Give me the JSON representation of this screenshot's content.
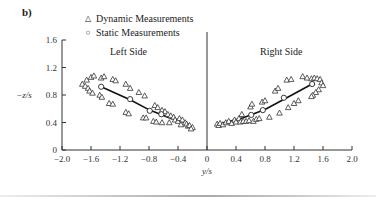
{
  "panel_label": "b)",
  "legend": {
    "dynamic": {
      "symbol": "△",
      "label": "Dynamic Measurements"
    },
    "static": {
      "symbol": "○",
      "label": "Static Measurements"
    }
  },
  "annotations": {
    "left": "Left Side",
    "right": "Right Side"
  },
  "chart_data": {
    "type": "scatter",
    "title": "",
    "xlabel": "y/s",
    "ylabel": "−z/s",
    "xlim": [
      -2.0,
      2.0
    ],
    "ylim": [
      0,
      1.6
    ],
    "x_ticks": [
      "−2.0",
      "−1.6",
      "−1.2",
      "−0.8",
      "−0.4",
      "0",
      "0.4",
      "0.8",
      "1.2",
      "1.6",
      "2.0"
    ],
    "y_ticks": [
      "0",
      "0.4",
      "0.8",
      "1.2",
      "1.6"
    ],
    "grid": false,
    "legend_position": "top-left",
    "annotations": [
      "Left Side",
      "Right Side"
    ],
    "series": [
      {
        "name": "Dynamic Measurements",
        "marker": "triangle",
        "points": [
          [
            -1.72,
            0.96
          ],
          [
            -1.68,
            0.93
          ],
          [
            -1.66,
            1.02
          ],
          [
            -1.64,
            0.9
          ],
          [
            -1.62,
            0.86
          ],
          [
            -1.6,
            1.06
          ],
          [
            -1.58,
            0.83
          ],
          [
            -1.56,
            1.08
          ],
          [
            -1.46,
            1.05
          ],
          [
            -1.42,
            1.07
          ],
          [
            -1.48,
            0.8
          ],
          [
            -1.45,
            0.77
          ],
          [
            -1.3,
            1.03
          ],
          [
            -1.26,
            1.01
          ],
          [
            -1.35,
            0.68
          ],
          [
            -1.3,
            0.67
          ],
          [
            -1.12,
            0.96
          ],
          [
            -1.06,
            0.9
          ],
          [
            -1.12,
            0.55
          ],
          [
            -1.08,
            0.53
          ],
          [
            -0.94,
            0.84
          ],
          [
            -0.86,
            0.79
          ],
          [
            -0.88,
            0.47
          ],
          [
            -0.84,
            0.47
          ],
          [
            -0.72,
            0.65
          ],
          [
            -0.68,
            0.62
          ],
          [
            -0.74,
            0.42
          ],
          [
            -0.7,
            0.41
          ],
          [
            -0.62,
            0.58
          ],
          [
            -0.58,
            0.56
          ],
          [
            -0.62,
            0.4
          ],
          [
            -0.54,
            0.52
          ],
          [
            -0.5,
            0.5
          ],
          [
            -0.46,
            0.48
          ],
          [
            -0.52,
            0.4
          ],
          [
            -0.44,
            0.44
          ],
          [
            -0.4,
            0.42
          ],
          [
            -0.38,
            0.46
          ],
          [
            -0.34,
            0.44
          ],
          [
            -0.3,
            0.4
          ],
          [
            -0.36,
            0.37
          ],
          [
            -0.28,
            0.38
          ],
          [
            -0.26,
            0.35
          ],
          [
            -0.24,
            0.36
          ],
          [
            -0.2,
            0.33
          ],
          [
            -0.22,
            0.31
          ],
          [
            0.14,
            0.38
          ],
          [
            0.16,
            0.36
          ],
          [
            0.18,
            0.39
          ],
          [
            0.22,
            0.37
          ],
          [
            0.26,
            0.4
          ],
          [
            0.3,
            0.42
          ],
          [
            0.34,
            0.39
          ],
          [
            0.38,
            0.44
          ],
          [
            0.4,
            0.41
          ],
          [
            0.44,
            0.46
          ],
          [
            0.46,
            0.41
          ],
          [
            0.48,
            0.52
          ],
          [
            0.5,
            0.42
          ],
          [
            0.54,
            0.42
          ],
          [
            0.58,
            0.43
          ],
          [
            0.6,
            0.63
          ],
          [
            0.62,
            0.67
          ],
          [
            0.64,
            0.42
          ],
          [
            0.68,
            0.45
          ],
          [
            0.72,
            0.46
          ],
          [
            0.76,
            0.7
          ],
          [
            0.8,
            0.72
          ],
          [
            0.86,
            0.48
          ],
          [
            0.94,
            0.86
          ],
          [
            0.98,
            0.9
          ],
          [
            1.0,
            0.54
          ],
          [
            1.1,
            1.02
          ],
          [
            1.16,
            1.03
          ],
          [
            1.12,
            0.62
          ],
          [
            1.2,
            0.68
          ],
          [
            1.26,
            0.72
          ],
          [
            1.32,
            1.07
          ],
          [
            1.38,
            1.05
          ],
          [
            1.44,
            1.04
          ],
          [
            1.48,
            1.05
          ],
          [
            1.52,
            1.04
          ],
          [
            1.56,
            1.03
          ],
          [
            1.58,
            0.98
          ],
          [
            1.6,
            0.94
          ],
          [
            1.54,
            0.88
          ],
          [
            1.5,
            0.84
          ],
          [
            1.46,
            0.8
          ],
          [
            1.44,
            0.78
          ]
        ]
      },
      {
        "name": "Static Measurements",
        "marker": "circle",
        "points": [
          [
            -1.46,
            0.92
          ],
          [
            -1.06,
            0.74
          ],
          [
            -0.79,
            0.57
          ],
          [
            -0.63,
            0.52
          ],
          [
            0.61,
            0.51
          ],
          [
            0.77,
            0.58
          ],
          [
            1.06,
            0.76
          ],
          [
            1.45,
            0.96
          ]
        ]
      }
    ],
    "fit_lines": [
      {
        "side": "left",
        "points": [
          [
            -1.46,
            0.92
          ],
          [
            -1.06,
            0.73
          ],
          [
            -0.79,
            0.58
          ],
          [
            -0.55,
            0.48
          ],
          [
            -0.3,
            0.4
          ]
        ]
      },
      {
        "side": "right",
        "points": [
          [
            0.2,
            0.39
          ],
          [
            0.5,
            0.47
          ],
          [
            0.8,
            0.59
          ],
          [
            1.1,
            0.76
          ],
          [
            1.45,
            0.96
          ]
        ]
      }
    ]
  }
}
